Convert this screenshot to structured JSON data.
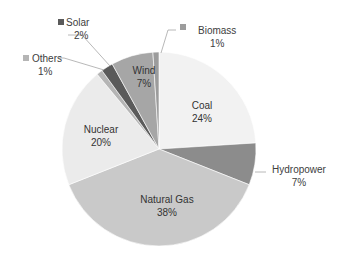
{
  "chart_data": {
    "type": "pie",
    "title": "",
    "start_angle_deg": 0,
    "direction": "clockwise",
    "slices": [
      {
        "name": "Coal",
        "value": 24,
        "label": "24%",
        "color": "#f2f2f2"
      },
      {
        "name": "Hydropower",
        "value": 7,
        "label": "7%",
        "color": "#8c8c8c"
      },
      {
        "name": "Natural Gas",
        "value": 38,
        "label": "38%",
        "color": "#c9c9c9"
      },
      {
        "name": "Nuclear",
        "value": 20,
        "label": "20%",
        "color": "#ebebeb"
      },
      {
        "name": "Others",
        "value": 1,
        "label": "1%",
        "color": "#b5b5b5"
      },
      {
        "name": "Solar",
        "value": 2,
        "label": "2%",
        "color": "#5a5a5a"
      },
      {
        "name": "Wind",
        "value": 7,
        "label": "7%",
        "color": "#a6a6a6"
      },
      {
        "name": "Biomass",
        "value": 1,
        "label": "1%",
        "color": "#9c9c9c"
      }
    ],
    "legend": "none (data labels on/near slices)"
  },
  "labels": {
    "coal": {
      "name": "Coal",
      "pct": "24%"
    },
    "hydro": {
      "name": "Hydropower",
      "pct": "7%"
    },
    "gas": {
      "name": "Natural Gas",
      "pct": "38%"
    },
    "nuclear": {
      "name": "Nuclear",
      "pct": "20%"
    },
    "others": {
      "name": "Others",
      "pct": "1%"
    },
    "solar": {
      "name": "Solar",
      "pct": "2%"
    },
    "wind": {
      "name": "Wind",
      "pct": "7%"
    },
    "biomass": {
      "name": "Biomass",
      "pct": "1%"
    }
  }
}
